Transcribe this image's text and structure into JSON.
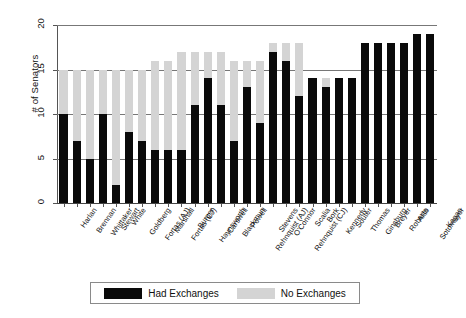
{
  "chart_data": {
    "type": "bar",
    "stacked": true,
    "title": "",
    "xlabel": "",
    "ylabel": "# of Senators",
    "ylim": [
      0,
      20
    ],
    "yticks": [
      0,
      5,
      10,
      15,
      20
    ],
    "grid": true,
    "legend_position": "bottom",
    "categories": [
      "Harlan",
      "Brennan",
      "Whittaker",
      "Stewart",
      "White",
      "Goldberg",
      "Fortas (AJ)",
      "Marshall",
      "Fortas (CJ)",
      "Burger",
      "Haynsworth",
      "Carswell",
      "Blackmun",
      "Powell",
      "Rehnquist (AJ)",
      "Stevens",
      "O'Connor",
      "Rehnquist (CJ)",
      "Scalia",
      "Bork",
      "Kennedy",
      "Souter",
      "Thomas",
      "Ginsburg",
      "Breyer",
      "Roberts",
      "Alito",
      "Sotomayor",
      "Kagan"
    ],
    "series": [
      {
        "name": "Had Exchanges",
        "color": "#0a0a0a",
        "values": [
          10,
          7,
          5,
          10,
          2,
          8,
          7,
          6,
          6,
          6,
          11,
          14,
          11,
          7,
          13,
          9,
          17,
          16,
          12,
          14,
          13,
          14,
          14,
          18,
          18,
          18,
          18,
          19,
          19
        ]
      },
      {
        "name": "No Exchanges",
        "color": "#d4d4d4",
        "values": [
          5,
          8,
          10,
          5,
          13,
          7,
          8,
          10,
          10,
          11,
          6,
          3,
          6,
          9,
          3,
          7,
          1,
          2,
          6,
          0,
          1,
          0,
          0,
          0,
          0,
          0,
          0,
          0,
          0
        ]
      }
    ],
    "totals": [
      15,
      15,
      15,
      15,
      15,
      15,
      15,
      16,
      16,
      17,
      17,
      17,
      17,
      16,
      16,
      16,
      18,
      18,
      18,
      14,
      14,
      14,
      14,
      18,
      18,
      18,
      18,
      19,
      19
    ]
  },
  "legend": {
    "entries": [
      {
        "label": "Had Exchanges",
        "swatch": "black"
      },
      {
        "label": "No Exchanges",
        "swatch": "lightgray"
      }
    ]
  },
  "axes": {
    "y_title": "# of Senators",
    "y_tick_labels": [
      "0",
      "5",
      "10",
      "15",
      "20"
    ]
  },
  "colors": {
    "had_exchanges": "#0a0a0a",
    "no_exchanges": "#d4d4d4",
    "grid": "#777777",
    "axis": "#555555",
    "background": "#ffffff"
  }
}
